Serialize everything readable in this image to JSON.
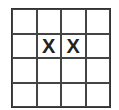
{
  "board": {
    "rows": 4,
    "cols": 4,
    "cells": [
      [
        "",
        "",
        "",
        ""
      ],
      [
        "",
        "X",
        "X",
        ""
      ],
      [
        "",
        "",
        "",
        ""
      ],
      [
        "",
        "",
        "",
        ""
      ]
    ]
  }
}
